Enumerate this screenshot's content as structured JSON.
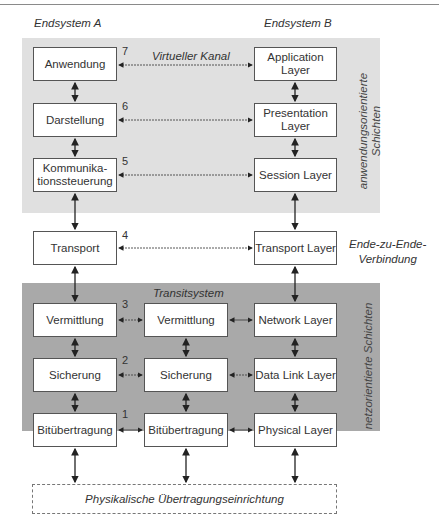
{
  "headers": {
    "endsystem_a": "Endsystem A",
    "endsystem_b": "Endsystem B"
  },
  "annotations": {
    "virtual_channel": "Virtueller Kanal",
    "transit_system": "Transitsystem",
    "end_to_end": "Ende-zu-Ende-\nVerbindung",
    "application_layers": "anwendungsorientierte\nSchichten",
    "network_layers": "netzorientierte Schichten",
    "physical_medium": "Physikalische Übertragungseinrichtung"
  },
  "layer_numbers": [
    "7",
    "6",
    "5",
    "4",
    "3",
    "2",
    "1"
  ],
  "endsystem_a_layers": [
    "Anwendung",
    "Darstellung",
    "Kommunika-\ntionssteuerung",
    "Transport",
    "Vermittlung",
    "Sicherung",
    "Bitübertragung"
  ],
  "transit_layers": [
    "Vermittlung",
    "Sicherung",
    "Bitübertragung"
  ],
  "endsystem_b_layers": [
    "Application\nLayer",
    "Presentation\nLayer",
    "Session Layer",
    "Transport Layer",
    "Network Layer",
    "Data Link Layer",
    "Physical Layer"
  ],
  "colors": {
    "application_region": "#e0e0e0",
    "network_region": "#a9a9a9",
    "box_border": "#555555"
  }
}
